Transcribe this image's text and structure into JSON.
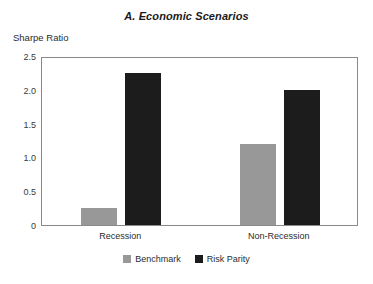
{
  "chart_data": {
    "type": "bar",
    "title": "A. Economic Scenarios",
    "xlabel": "",
    "ylabel": "Sharpe Ratio",
    "categories": [
      "Recession",
      "Non-Recession"
    ],
    "series": [
      {
        "name": "Benchmark",
        "color": "#989898",
        "values": [
          0.25,
          1.2
        ]
      },
      {
        "name": "Risk Parity",
        "color": "#1c1c1c",
        "values": [
          2.25,
          2.0
        ]
      }
    ],
    "ylim": [
      0,
      2.5
    ],
    "yticks": [
      0,
      0.5,
      1.0,
      1.5,
      2.0,
      2.5
    ],
    "ytick_labels": [
      "0",
      "0.5",
      "1.0",
      "1.5",
      "2.0",
      "2.5"
    ],
    "grid": false,
    "legend_position": "bottom-center",
    "frame": true
  }
}
